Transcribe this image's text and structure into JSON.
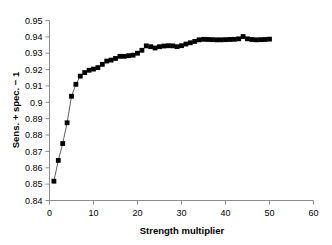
{
  "chart_data": {
    "type": "scatter",
    "title": "",
    "subtitle": "",
    "xlabel": "Strength multiplier",
    "ylabel": "Sens. + spec. − 1",
    "xlim": [
      0,
      60
    ],
    "ylim": [
      0.84,
      0.95
    ],
    "xticks": [
      0,
      10,
      20,
      30,
      40,
      50,
      60
    ],
    "xticklabels": [
      "0",
      "10",
      "20",
      "30",
      "40",
      "50",
      "60"
    ],
    "yticks": [
      0.84,
      0.85,
      0.86,
      0.87,
      0.88,
      0.89,
      0.9,
      0.91,
      0.92,
      0.93,
      0.94,
      0.95
    ],
    "yticklabels": [
      "0.84",
      "0.85",
      "0.86",
      "0.87",
      "0.88",
      "0.89",
      "0.9",
      "0.91",
      "0.92",
      "0.93",
      "0.94",
      "0.95"
    ],
    "grid": false,
    "legend": null,
    "marker": "square",
    "marker_color": "#000000",
    "line_color": "#4d4d4d",
    "series": [
      {
        "name": "Sens. + spec. - 1 vs strength multiplier",
        "x": [
          1,
          2,
          3,
          4,
          5,
          6,
          7,
          8,
          9,
          10,
          11,
          12,
          13,
          14,
          15,
          16,
          17,
          18,
          19,
          20,
          21,
          22,
          23,
          24,
          25,
          26,
          27,
          28,
          29,
          30,
          31,
          32,
          33,
          34,
          35,
          36,
          37,
          38,
          39,
          40,
          41,
          42,
          43,
          44,
          45,
          46,
          47,
          48,
          49,
          50
        ],
        "y": [
          0.8518,
          0.8645,
          0.8748,
          0.8875,
          0.9037,
          0.911,
          0.916,
          0.9182,
          0.9196,
          0.9203,
          0.9212,
          0.9232,
          0.9252,
          0.9258,
          0.9268,
          0.9281,
          0.9281,
          0.9285,
          0.9288,
          0.93,
          0.9318,
          0.9345,
          0.934,
          0.9332,
          0.934,
          0.9344,
          0.9346,
          0.9345,
          0.934,
          0.9346,
          0.9356,
          0.9364,
          0.9372,
          0.9382,
          0.9385,
          0.9384,
          0.9383,
          0.9382,
          0.9382,
          0.9383,
          0.9384,
          0.9385,
          0.9388,
          0.9402,
          0.9388,
          0.9384,
          0.9382,
          0.9383,
          0.9384,
          0.9386
        ]
      }
    ]
  },
  "axis_titles": {
    "x": "Strength multiplier",
    "y": "Sens. + spec. − 1"
  }
}
